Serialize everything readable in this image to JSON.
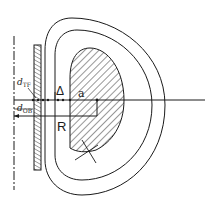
{
  "diagram": {
    "colors": {
      "line": "#1a1a1a",
      "background": "#ffffff"
    },
    "labels": {
      "d_tf": {
        "main": "d",
        "sub": "TF"
      },
      "delta": "Δ",
      "a": "a",
      "d_ob": {
        "main": "d",
        "sub": "OB"
      },
      "R": "R"
    },
    "components": [
      {
        "id": "axis",
        "description": "dashed vertical machine axis"
      },
      {
        "id": "tf-coil-inboard-leg",
        "description": "hatched vertical TF coil leg"
      },
      {
        "id": "outer-boundary",
        "description": "outer D-shaped shell boundary"
      },
      {
        "id": "inner-boundary",
        "description": "inner D-shaped shell boundary"
      },
      {
        "id": "plasma",
        "description": "hatched D-shaped plasma cross-section"
      },
      {
        "id": "midplane",
        "description": "horizontal midplane line"
      },
      {
        "id": "major-radius-arrow",
        "description": "major radius R dimension"
      }
    ]
  }
}
